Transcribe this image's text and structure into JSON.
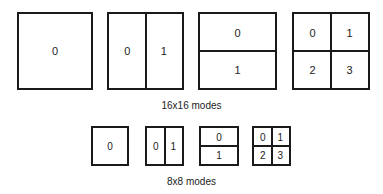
{
  "groups": [
    {
      "caption": "16x16 modes",
      "modes": [
        {
          "layout": "whole",
          "labels": [
            "0"
          ]
        },
        {
          "layout": "vertical-split",
          "labels": [
            "0",
            "1"
          ]
        },
        {
          "layout": "horizontal-split",
          "labels": [
            "0",
            "1"
          ]
        },
        {
          "layout": "quad-split",
          "labels": [
            "0",
            "1",
            "2",
            "3"
          ]
        }
      ]
    },
    {
      "caption": "8x8 modes",
      "modes": [
        {
          "layout": "whole",
          "labels": [
            "0"
          ]
        },
        {
          "layout": "vertical-split",
          "labels": [
            "0",
            "1"
          ]
        },
        {
          "layout": "horizontal-split",
          "labels": [
            "0",
            "1"
          ]
        },
        {
          "layout": "quad-split",
          "labels": [
            "0",
            "1",
            "2",
            "3"
          ]
        }
      ]
    }
  ]
}
